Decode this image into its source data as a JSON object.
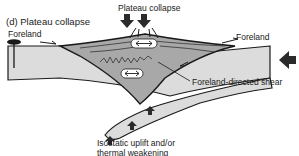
{
  "panel": {
    "title": "(d) Plateau collapse"
  },
  "labels": {
    "plateau_collapse": "Plateau collapse",
    "foreland_left": "Foreland",
    "foreland_right": "Foreland",
    "foreland_directed_shear": "Foreland-directed shear",
    "uplift_line1": "Isostatic uplift and/or",
    "uplift_line2": "thermal weakening"
  },
  "icons": {
    "down_arrows": [
      "down-arrow",
      "down-arrow"
    ],
    "up_arrows": [
      "up-arrow",
      "up-arrow",
      "up-arrow"
    ],
    "convergence_arrow": "left-arrow",
    "extension_symbols": [
      "double-headed-arrow",
      "double-headed-arrow"
    ],
    "fault_pin": "pin"
  },
  "colors": {
    "plate_fill": "#dcdcdc",
    "wedge_fill": "#a8a8a8",
    "outline": "#1a1a1a",
    "arrow_fill": "#2b2b2b"
  }
}
